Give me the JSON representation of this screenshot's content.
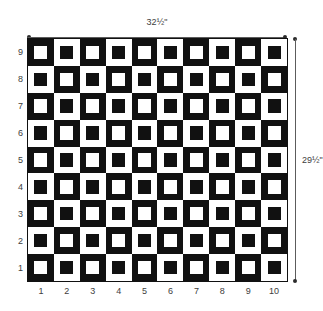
{
  "diagram": {
    "background_color": "#ffffff",
    "dark_color": "#111111",
    "light_color": "#ffffff",
    "label_color": "#3d3d3d",
    "dimension_line_color": "#5c5c5c"
  },
  "dimensions": {
    "width_label": "32½\"",
    "height_label": "29½\""
  },
  "axes": {
    "column_labels": [
      "1",
      "2",
      "3",
      "4",
      "5",
      "6",
      "7",
      "8",
      "9",
      "10"
    ],
    "row_labels": [
      "9",
      "8",
      "7",
      "6",
      "5",
      "4",
      "3",
      "2",
      "1"
    ]
  },
  "chart_data": {
    "type": "heatmap",
    "xlabel": "",
    "ylabel": "",
    "columns": 10,
    "rows": 9,
    "legend": [
      {
        "name": "dark block with light center",
        "value": 1,
        "color": "#111111"
      },
      {
        "name": "light block with dark center",
        "value": 0,
        "color": "#ffffff"
      }
    ],
    "x_tick_labels": [
      "1",
      "2",
      "3",
      "4",
      "5",
      "6",
      "7",
      "8",
      "9",
      "10"
    ],
    "y_tick_labels": [
      "9",
      "8",
      "7",
      "6",
      "5",
      "4",
      "3",
      "2",
      "1"
    ],
    "annotations": [
      "32½\"",
      "29½\""
    ],
    "grid": [
      [
        1,
        0,
        1,
        0,
        1,
        0,
        1,
        0,
        1,
        0
      ],
      [
        0,
        1,
        0,
        1,
        0,
        1,
        0,
        1,
        0,
        1
      ],
      [
        1,
        0,
        1,
        0,
        1,
        0,
        1,
        0,
        1,
        0
      ],
      [
        0,
        1,
        0,
        1,
        0,
        1,
        0,
        1,
        0,
        1
      ],
      [
        1,
        0,
        1,
        0,
        1,
        0,
        1,
        0,
        1,
        0
      ],
      [
        0,
        1,
        0,
        1,
        0,
        1,
        0,
        1,
        0,
        1
      ],
      [
        1,
        0,
        1,
        0,
        1,
        0,
        1,
        0,
        1,
        0
      ],
      [
        0,
        1,
        0,
        1,
        0,
        1,
        0,
        1,
        0,
        1
      ],
      [
        1,
        0,
        1,
        0,
        1,
        0,
        1,
        0,
        1,
        0
      ]
    ]
  }
}
